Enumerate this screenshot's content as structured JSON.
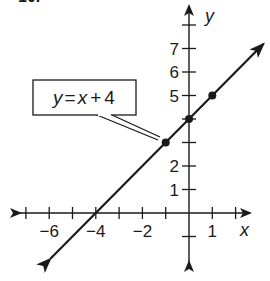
{
  "problem_number": "10.",
  "chart_data": {
    "type": "line",
    "title": "",
    "xlabel": "x",
    "ylabel": "y",
    "equation": "y = x + 4",
    "callout_label": {
      "y": "y",
      "eq": "=",
      "x": "x",
      "plus": "+",
      "c": "4"
    },
    "slope": 1,
    "intercept": 4,
    "xlim": [
      -7.5,
      3
    ],
    "ylim": [
      -2,
      8.5
    ],
    "x_ticks": [
      -7,
      -6,
      -5,
      -4,
      -3,
      -2,
      -1,
      1,
      2
    ],
    "x_tick_labels": [
      {
        "value": -6,
        "label": "−6"
      },
      {
        "value": -4,
        "label": "−4"
      },
      {
        "value": -2,
        "label": "−2"
      },
      {
        "value": 1,
        "label": "1"
      }
    ],
    "y_ticks": [
      -1,
      1,
      2,
      3,
      4,
      5,
      6,
      7,
      8
    ],
    "y_tick_labels": [
      {
        "value": 1,
        "label": "1"
      },
      {
        "value": 2,
        "label": "2"
      },
      {
        "value": 5,
        "label": "5"
      },
      {
        "value": 6,
        "label": "6"
      },
      {
        "value": 7,
        "label": "7"
      }
    ],
    "points": [
      {
        "x": -1,
        "y": 3
      },
      {
        "x": 0,
        "y": 4
      },
      {
        "x": 1,
        "y": 5
      }
    ],
    "x_intercept": {
      "x": -4,
      "y": 0
    },
    "grid": false,
    "legend": null
  }
}
